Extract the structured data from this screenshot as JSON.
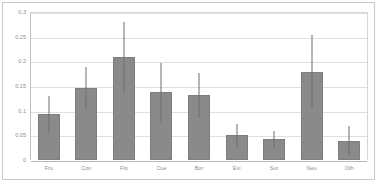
{
  "chart_data": {
    "type": "bar",
    "title": "",
    "subtitle": "",
    "xlabel": "",
    "ylabel": "",
    "ylim": [
      0,
      0.3
    ],
    "ytick_labels": [
      "0.3",
      "0.25",
      "0.2",
      "0.15",
      "0.1",
      "0.05",
      "0"
    ],
    "ytick_values": [
      0.3,
      0.25,
      0.2,
      0.15,
      0.1,
      0.05,
      0
    ],
    "grid": true,
    "legend": false,
    "legend_position": "none",
    "error_bars": true,
    "bar_color": "#8a8a8a",
    "error_bar_color": "#6f6f6f",
    "gridline_color": "#dfdfdf",
    "categories": [
      "Fru",
      "Con",
      "Flo",
      "Cue",
      "Bor",
      "Evi",
      "Sur",
      "Neu",
      "Oth"
    ],
    "values": [
      0.094,
      0.145,
      0.209,
      0.138,
      0.132,
      0.05,
      0.042,
      0.179,
      0.038
    ],
    "error_high": [
      0.13,
      0.189,
      0.28,
      0.197,
      0.176,
      0.073,
      0.058,
      0.254,
      0.068
    ],
    "error_low": [
      0.055,
      0.103,
      0.136,
      0.076,
      0.086,
      0.026,
      0.024,
      0.105,
      0.01
    ]
  }
}
